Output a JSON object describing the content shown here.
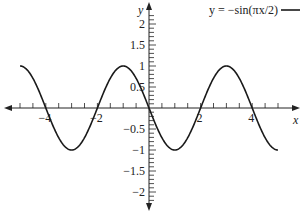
{
  "chart_data": {
    "type": "line",
    "title": "",
    "xlabel": "x",
    "ylabel": "y",
    "xlim": [
      -5,
      5
    ],
    "ylim": [
      -2.3,
      2.3
    ],
    "grid": false,
    "legend_position": "top-right",
    "x_ticks": [
      -4,
      -2,
      2,
      4
    ],
    "x_tick_labels": [
      "−4",
      "−2",
      "2",
      "4"
    ],
    "x_minor_step": 0.5,
    "y_ticks": [
      2,
      1.5,
      1,
      0.5,
      -0.5,
      -1,
      -1.5,
      -2
    ],
    "y_tick_labels": [
      "2",
      "1.5",
      "1",
      "0.5",
      "−0.5",
      "−1",
      "−1.5",
      "−2"
    ],
    "y_minor_step": 0.1,
    "series": [
      {
        "name": "y = −sin(πx/2)",
        "function": "-sin(pi*x/2)",
        "domain": [
          -5,
          5
        ],
        "color": "#1a1a1a",
        "x": [
          -5,
          -4,
          -3,
          -2,
          -1,
          0,
          1,
          2,
          3,
          4,
          5
        ],
        "values": [
          1,
          0,
          -1,
          0,
          1,
          0,
          -1,
          0,
          1,
          0,
          -1
        ]
      }
    ]
  }
}
